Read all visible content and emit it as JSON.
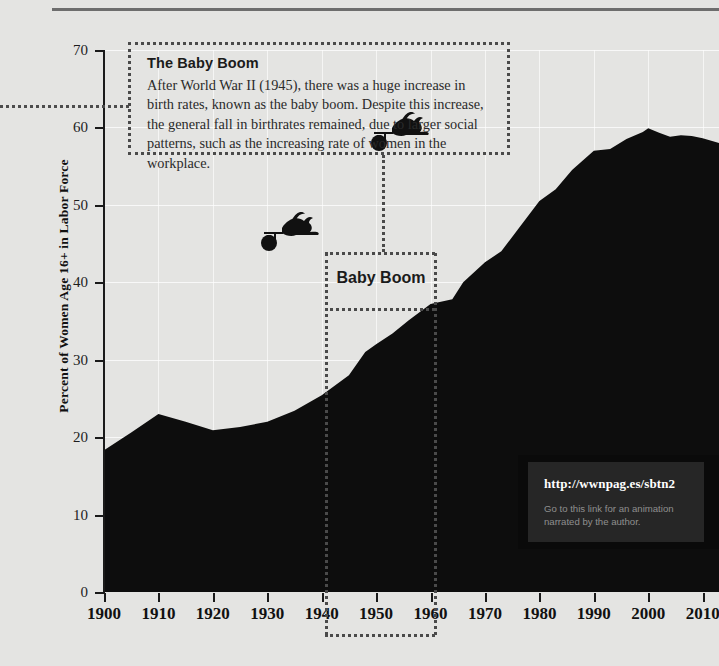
{
  "figure": {
    "background_color": "#e4e4e2",
    "series_color": "#0d0d0d"
  },
  "annotation": {
    "title": "The Baby Boom",
    "body": "After World War II (1945), there was a huge increase in birth rates, known as the baby boom. Despite this increase, the general fall in birthrates remained, due to larger social patterns, such as the increasing rate of women in the workplace."
  },
  "baby_boom_band": {
    "label": "Baby Boom",
    "start_year": 1946,
    "end_year": 1964
  },
  "url_callout": {
    "url": "http://wwnpag.es/sbtn2",
    "caption": "Go to this link for an animation narrated by the author.",
    "background_color": "#262626",
    "url_color": "#ffffff",
    "caption_color": "#8f8f8f"
  },
  "illustrations": [
    {
      "name": "stork-carrying-bundle",
      "year": 1934,
      "value": 45.5
    },
    {
      "name": "stork-carrying-bundle",
      "year": 1919,
      "value": 33.5
    }
  ],
  "chart_data": {
    "type": "area",
    "title": "",
    "xlabel": "",
    "ylabel": "Percent of Women Age 16+ in Labor Force",
    "xlim": [
      1900,
      2013
    ],
    "ylim": [
      0,
      70
    ],
    "xticks": [
      1900,
      1910,
      1920,
      1930,
      1940,
      1950,
      1960,
      1970,
      1980,
      1990,
      2000,
      2010
    ],
    "yticks": [
      0,
      10,
      20,
      30,
      40,
      50,
      60,
      70
    ],
    "grid": true,
    "legend": "none",
    "series": [
      {
        "name": "Percent of Women Age 16+ in Labor Force",
        "color": "#0d0d0d",
        "x": [
          1900,
          1905,
          1910,
          1915,
          1920,
          1925,
          1930,
          1935,
          1940,
          1945,
          1948,
          1950,
          1953,
          1956,
          1960,
          1964,
          1966,
          1970,
          1973,
          1976,
          1980,
          1983,
          1986,
          1990,
          1993,
          1996,
          1999,
          2000,
          2002,
          2004,
          2006,
          2008,
          2010,
          2013
        ],
        "values": [
          18.3,
          20.6,
          23.0,
          22.0,
          20.9,
          21.3,
          22.0,
          23.4,
          25.4,
          28.0,
          31.0,
          32.0,
          33.4,
          35.1,
          37.2,
          37.8,
          40.0,
          42.6,
          44.0,
          46.8,
          50.5,
          52.0,
          54.5,
          57.0,
          57.2,
          58.5,
          59.4,
          59.9,
          59.3,
          58.8,
          59.0,
          58.9,
          58.6,
          58.0
        ]
      }
    ]
  },
  "axes": {
    "y_title": "Percent of Women Age 16+ in Labor Force",
    "y_tick_labels": [
      "0",
      "10",
      "20",
      "30",
      "40",
      "50",
      "60",
      "70"
    ],
    "x_tick_labels": [
      "1900",
      "1910",
      "1920",
      "1930",
      "1940",
      "1950",
      "1960",
      "1970",
      "1980",
      "1990",
      "2000",
      "2010"
    ]
  }
}
